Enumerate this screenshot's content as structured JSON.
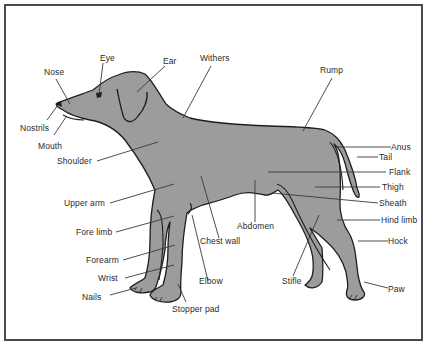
{
  "diagram": {
    "colors": {
      "body_fill": "#9c9c9c",
      "outline": "#1e1e1e",
      "leader": "#3a3a3a",
      "frame": "#4a4a4a",
      "text": "#2a2a2a"
    },
    "labels": {
      "eye": "Eye",
      "ear": "Ear",
      "withers": "Withers",
      "rump": "Rump",
      "nose": "Nose",
      "nostrils": "Nostrils",
      "mouth": "Mouth",
      "shoulder": "Shoulder",
      "anus": "Anus",
      "tail": "Tail",
      "flank": "Flank",
      "thigh": "Thigh",
      "sheath": "Sheath",
      "hind_limb": "Hind limb",
      "hock": "Hock",
      "paw": "Paw",
      "upper_arm": "Upper arm",
      "fore_limb": "Fore limb",
      "forearm": "Forearm",
      "wrist": "Wrist",
      "nails": "Nails",
      "chest_wall": "Chest wall",
      "abdomen": "Abdomen",
      "elbow": "Elbow",
      "stopper_pad": "Stopper pad",
      "stifle": "Stifle"
    }
  }
}
